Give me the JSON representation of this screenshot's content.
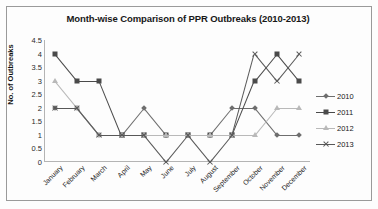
{
  "chart_data": {
    "type": "line",
    "title": "Month-wise Comparison of PPR Outbreaks (2010-2013)",
    "xlabel": "",
    "ylabel": "No. of Outbreaks",
    "ylim": [
      0,
      4.5
    ],
    "ytick_step": 0.5,
    "grid": false,
    "legend_position": "right",
    "categories": [
      "January",
      "February",
      "March",
      "April",
      "May",
      "June",
      "July",
      "August",
      "September",
      "October",
      "November",
      "December"
    ],
    "ytick_labels": [
      "4.5",
      "4",
      "3.5",
      "3",
      "2.5",
      "2",
      "1.5",
      "1",
      "0.5",
      "0"
    ],
    "series": [
      {
        "name": "2010",
        "marker": "diamond",
        "color": "#6e6e6e",
        "values": [
          2,
          2,
          1,
          1,
          2,
          1,
          1,
          1,
          2,
          2,
          1,
          1
        ]
      },
      {
        "name": "2011",
        "marker": "square",
        "color": "#4a4a4a",
        "values": [
          4,
          3,
          3,
          1,
          1,
          1,
          1,
          1,
          1,
          3,
          4,
          3
        ]
      },
      {
        "name": "2012",
        "marker": "triangle",
        "color": "#b9b9b9",
        "values": [
          3,
          2,
          1,
          1,
          1,
          1,
          1,
          1,
          1,
          1,
          2,
          2
        ]
      },
      {
        "name": "2013",
        "marker": "x",
        "color": "#585858",
        "values": [
          2,
          2,
          1,
          1,
          1,
          0,
          1,
          0,
          1,
          4,
          3,
          4
        ]
      }
    ]
  },
  "legend": {
    "items": [
      {
        "label": "2010"
      },
      {
        "label": "2011"
      },
      {
        "label": "2012"
      },
      {
        "label": "2013"
      }
    ]
  }
}
